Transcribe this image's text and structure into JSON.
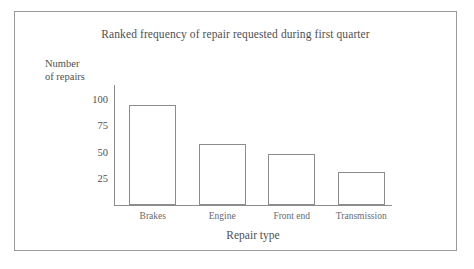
{
  "chart_data": {
    "type": "bar",
    "title": "Ranked frequency of repair requested during first quarter",
    "xlabel": "Repair type",
    "ylabel_line1": "Number",
    "ylabel_line2": "of repairs",
    "categories": [
      "Brakes",
      "Engine",
      "Front end",
      "Transmission"
    ],
    "values": [
      94,
      57,
      48,
      31
    ],
    "yticks": [
      100,
      75,
      50,
      25
    ],
    "ylim": [
      0,
      113
    ],
    "grid": false,
    "legend": false,
    "bar_fill": "#ffffff",
    "bar_stroke": "#8c8c8c",
    "axis_color": "#8c8c8c",
    "text_color": "#4f4f4f",
    "frame_color": "#9a9a9a",
    "background": "#ffffff"
  }
}
